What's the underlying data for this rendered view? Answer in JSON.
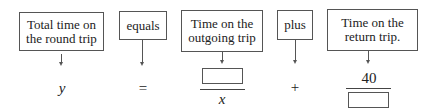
{
  "diagram": {
    "boxes": [
      {
        "id": "total",
        "line1": "Total time on",
        "line2": "the round trip"
      },
      {
        "id": "equals",
        "line1": "equals"
      },
      {
        "id": "outgoing",
        "line1": "Time on the",
        "line2": "outgoing trip"
      },
      {
        "id": "plus",
        "line1": "plus"
      },
      {
        "id": "return",
        "line1": "Time on the",
        "line2": "return trip."
      }
    ],
    "equation": {
      "lhs": "y",
      "equals": "=",
      "term1": {
        "numerator": "",
        "denominator": "x"
      },
      "plus": "+",
      "term2": {
        "numerator": "40",
        "denominator": ""
      }
    }
  }
}
